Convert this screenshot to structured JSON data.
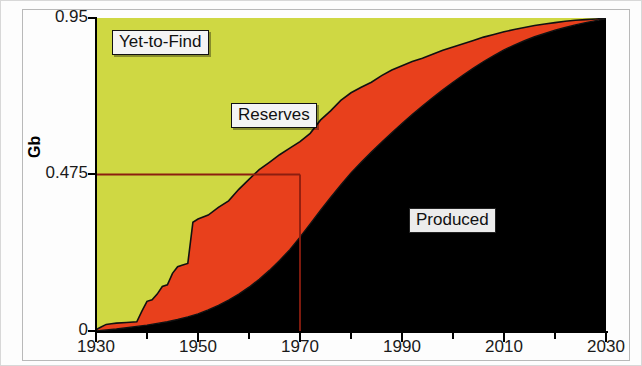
{
  "chart_data": {
    "type": "area",
    "title": "",
    "subtitle": "",
    "xlabel": "",
    "ylabel": "Gb",
    "xlim": [
      1930,
      2030
    ],
    "ylim": [
      0,
      0.95
    ],
    "grid": false,
    "legend_position": "inline-labels",
    "stacking": "stacked-cumulative",
    "x_ticks_major": [
      1930,
      1950,
      1970,
      1990,
      2010,
      2030
    ],
    "x_ticks_minor_step": 10,
    "y_ticks": [
      0,
      0.475,
      0.95
    ],
    "y_tick_labels": [
      "0",
      "0.475",
      "0.95"
    ],
    "series": [
      {
        "name": "Produced",
        "color": "#000000",
        "label": "Produced",
        "description": "Cumulative oil produced, rises from 0 in 1930 to near 0.95 Gb by 2030",
        "points": [
          [
            1930,
            0.0
          ],
          [
            1932,
            0.003
          ],
          [
            1934,
            0.006
          ],
          [
            1936,
            0.01
          ],
          [
            1938,
            0.014
          ],
          [
            1940,
            0.018
          ],
          [
            1942,
            0.023
          ],
          [
            1944,
            0.028
          ],
          [
            1946,
            0.035
          ],
          [
            1948,
            0.043
          ],
          [
            1950,
            0.052
          ],
          [
            1952,
            0.064
          ],
          [
            1954,
            0.078
          ],
          [
            1956,
            0.094
          ],
          [
            1958,
            0.112
          ],
          [
            1960,
            0.133
          ],
          [
            1962,
            0.157
          ],
          [
            1964,
            0.184
          ],
          [
            1966,
            0.214
          ],
          [
            1968,
            0.247
          ],
          [
            1970,
            0.285
          ],
          [
            1972,
            0.325
          ],
          [
            1974,
            0.366
          ],
          [
            1976,
            0.405
          ],
          [
            1978,
            0.443
          ],
          [
            1980,
            0.48
          ],
          [
            1982,
            0.512
          ],
          [
            1984,
            0.543
          ],
          [
            1986,
            0.573
          ],
          [
            1988,
            0.602
          ],
          [
            1990,
            0.63
          ],
          [
            1992,
            0.657
          ],
          [
            1994,
            0.683
          ],
          [
            1996,
            0.708
          ],
          [
            1998,
            0.732
          ],
          [
            2000,
            0.755
          ],
          [
            2002,
            0.777
          ],
          [
            2004,
            0.798
          ],
          [
            2006,
            0.818
          ],
          [
            2008,
            0.836
          ],
          [
            2010,
            0.853
          ],
          [
            2012,
            0.868
          ],
          [
            2014,
            0.881
          ],
          [
            2016,
            0.893
          ],
          [
            2018,
            0.903
          ],
          [
            2020,
            0.913
          ],
          [
            2022,
            0.921
          ],
          [
            2024,
            0.929
          ],
          [
            2026,
            0.936
          ],
          [
            2028,
            0.942
          ],
          [
            2030,
            0.948
          ]
        ]
      },
      {
        "name": "Reserves",
        "color": "#e8401c",
        "label": "Reserves",
        "description": "Discovered but unproduced reserves; upper boundary of red band (Produced + Reserves)",
        "upper_boundary": [
          [
            1930,
            0.004
          ],
          [
            1931,
            0.012
          ],
          [
            1932,
            0.02
          ],
          [
            1933,
            0.022
          ],
          [
            1934,
            0.024
          ],
          [
            1936,
            0.026
          ],
          [
            1938,
            0.028
          ],
          [
            1939,
            0.06
          ],
          [
            1940,
            0.09
          ],
          [
            1941,
            0.095
          ],
          [
            1942,
            0.112
          ],
          [
            1943,
            0.135
          ],
          [
            1944,
            0.14
          ],
          [
            1945,
            0.175
          ],
          [
            1946,
            0.195
          ],
          [
            1947,
            0.2
          ],
          [
            1948,
            0.205
          ],
          [
            1949,
            0.33
          ],
          [
            1950,
            0.34
          ],
          [
            1952,
            0.352
          ],
          [
            1954,
            0.375
          ],
          [
            1956,
            0.395
          ],
          [
            1958,
            0.43
          ],
          [
            1960,
            0.46
          ],
          [
            1962,
            0.49
          ],
          [
            1964,
            0.512
          ],
          [
            1966,
            0.535
          ],
          [
            1968,
            0.555
          ],
          [
            1970,
            0.575
          ],
          [
            1972,
            0.6
          ],
          [
            1974,
            0.64
          ],
          [
            1976,
            0.668
          ],
          [
            1978,
            0.7
          ],
          [
            1980,
            0.723
          ],
          [
            1982,
            0.74
          ],
          [
            1984,
            0.755
          ],
          [
            1986,
            0.775
          ],
          [
            1988,
            0.792
          ],
          [
            1990,
            0.805
          ],
          [
            1992,
            0.818
          ],
          [
            1994,
            0.828
          ],
          [
            1996,
            0.84
          ],
          [
            1998,
            0.852
          ],
          [
            2000,
            0.862
          ],
          [
            2002,
            0.872
          ],
          [
            2004,
            0.882
          ],
          [
            2006,
            0.892
          ],
          [
            2008,
            0.9
          ],
          [
            2010,
            0.908
          ],
          [
            2012,
            0.915
          ],
          [
            2014,
            0.921
          ],
          [
            2016,
            0.927
          ],
          [
            2018,
            0.932
          ],
          [
            2020,
            0.936
          ],
          [
            2022,
            0.94
          ],
          [
            2024,
            0.943
          ],
          [
            2026,
            0.945
          ],
          [
            2028,
            0.947
          ],
          [
            2030,
            0.949
          ]
        ]
      },
      {
        "name": "Yet-to-Find",
        "color": "#cfd843",
        "label": "Yet-to-Find",
        "description": "Remaining undiscovered resource; fills from Reserves boundary up to the 0.95 Gb ceiling",
        "upper_boundary_constant": 0.95
      }
    ],
    "annotations": [
      {
        "name": "midpoint-marker",
        "type": "crosshair",
        "x": 1970,
        "y": 0.475,
        "color": "#8c1e10",
        "description": "Horizontal line at 0.475 Gb meeting vertical line at year 1970 — the depletion midpoint"
      }
    ]
  },
  "axes": {
    "y": {
      "label": "Gb",
      "ticks": [
        {
          "value": "0.95",
          "pos": 0.95
        },
        {
          "value": "0.475",
          "pos": 0.475
        },
        {
          "value": "0",
          "pos": 0
        }
      ]
    },
    "x": {
      "label": "",
      "ticks": [
        {
          "value": "1930",
          "pos": 1930
        },
        {
          "value": "1950",
          "pos": 1950
        },
        {
          "value": "1970",
          "pos": 1970
        },
        {
          "value": "1990",
          "pos": 1990
        },
        {
          "value": "2010",
          "pos": 2010
        },
        {
          "value": "2030",
          "pos": 2030
        }
      ]
    }
  },
  "labels": {
    "yet_to_find": "Yet-to-Find",
    "reserves": "Reserves",
    "produced": "Produced"
  },
  "colors": {
    "yet_to_find": "#cfd843",
    "reserves": "#e8401c",
    "produced": "#000000",
    "marker_line": "#8c1e10",
    "axis": "#000000"
  }
}
